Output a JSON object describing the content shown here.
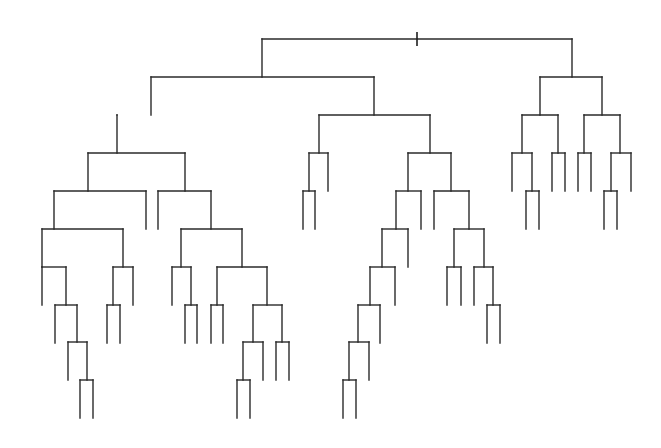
{
  "diagram": {
    "type": "dendrogram",
    "orientation": "top-down",
    "line_color": "#2a2a2a",
    "background": "#ffffff",
    "level_y": [
      39,
      77,
      115,
      153,
      191,
      229,
      267,
      305,
      342,
      380,
      418
    ],
    "leaf_length": 38,
    "root_tick": {
      "x": 417,
      "y1": 32,
      "y2": 46
    },
    "tree": {
      "x": 417,
      "children": [
        {
          "x": 262,
          "children": [
            {
              "x": 151,
              "children": [
                {
                  "x": 117,
                  "children": [
                    {
                      "x": 88,
                      "children": [
                        {
                          "x": 54,
                          "children": [
                            {
                              "x": 42,
                              "children": [
                                {
                                  "x": 42,
                                  "leaf": true
                                },
                                {
                                  "x": 66,
                                  "children": [
                                    {
                                      "x": 55,
                                      "leaf": true
                                    },
                                    {
                                      "x": 77,
                                      "children": [
                                        {
                                          "x": 68,
                                          "leaf": true
                                        },
                                        {
                                          "x": 87,
                                          "children": [
                                            {
                                              "x": 80,
                                              "leaf": true
                                            },
                                            {
                                              "x": 93,
                                              "leaf": true
                                            }
                                          ]
                                        }
                                      ]
                                    }
                                  ]
                                }
                              ]
                            },
                            {
                              "x": 123,
                              "children": [
                                {
                                  "x": 113,
                                  "children": [
                                    {
                                      "x": 107,
                                      "leaf": true
                                    },
                                    {
                                      "x": 120,
                                      "leaf": true
                                    }
                                  ]
                                },
                                {
                                  "x": 133,
                                  "leaf": true
                                }
                              ]
                            }
                          ]
                        },
                        {
                          "x": 146,
                          "leaf": true
                        }
                      ]
                    },
                    {
                      "x": 185,
                      "children": [
                        {
                          "x": 158,
                          "leaf": true
                        },
                        {
                          "x": 211,
                          "children": [
                            {
                              "x": 181,
                              "children": [
                                {
                                  "x": 172,
                                  "leaf": true
                                },
                                {
                                  "x": 191,
                                  "children": [
                                    {
                                      "x": 185,
                                      "leaf": true
                                    },
                                    {
                                      "x": 197,
                                      "leaf": true
                                    }
                                  ]
                                }
                              ]
                            },
                            {
                              "x": 242,
                              "children": [
                                {
                                  "x": 217,
                                  "children": [
                                    {
                                      "x": 211,
                                      "leaf": true
                                    },
                                    {
                                      "x": 223,
                                      "leaf": true
                                    }
                                  ]
                                },
                                {
                                  "x": 267,
                                  "children": [
                                    {
                                      "x": 253,
                                      "children": [
                                        {
                                          "x": 243,
                                          "children": [
                                            {
                                              "x": 237,
                                              "leaf": true
                                            },
                                            {
                                              "x": 250,
                                              "leaf": true
                                            }
                                          ]
                                        },
                                        {
                                          "x": 263,
                                          "leaf": true
                                        }
                                      ]
                                    },
                                    {
                                      "x": 282,
                                      "children": [
                                        {
                                          "x": 276,
                                          "leaf": true
                                        },
                                        {
                                          "x": 289,
                                          "leaf": true
                                        }
                                      ]
                                    }
                                  ]
                                }
                              ]
                            }
                          ]
                        }
                      ]
                    }
                  ]
                }
              ]
            },
            {
              "x": 374,
              "children": [
                {
                  "x": 319,
                  "children": [
                    {
                      "x": 309,
                      "children": [
                        {
                          "x": 303,
                          "leaf": true
                        },
                        {
                          "x": 315,
                          "leaf": true
                        }
                      ]
                    },
                    {
                      "x": 328,
                      "leaf": true
                    }
                  ]
                },
                {
                  "x": 430,
                  "children": [
                    {
                      "x": 408,
                      "children": [
                        {
                          "x": 396,
                          "children": [
                            {
                              "x": 382,
                              "children": [
                                {
                                  "x": 370,
                                  "children": [
                                    {
                                      "x": 358,
                                      "children": [
                                        {
                                          "x": 349,
                                          "children": [
                                            {
                                              "x": 343,
                                              "leaf": true
                                            },
                                            {
                                              "x": 356,
                                              "leaf": true
                                            }
                                          ]
                                        },
                                        {
                                          "x": 369,
                                          "leaf": true
                                        }
                                      ]
                                    },
                                    {
                                      "x": 380,
                                      "leaf": true
                                    }
                                  ]
                                },
                                {
                                  "x": 395,
                                  "leaf": true
                                }
                              ]
                            },
                            {
                              "x": 408,
                              "leaf": true
                            }
                          ]
                        },
                        {
                          "x": 421,
                          "leaf": true
                        }
                      ]
                    },
                    {
                      "x": 451,
                      "children": [
                        {
                          "x": 434,
                          "leaf": true
                        },
                        {
                          "x": 469,
                          "children": [
                            {
                              "x": 454,
                              "children": [
                                {
                                  "x": 447,
                                  "leaf": true
                                },
                                {
                                  "x": 461,
                                  "leaf": true
                                }
                              ]
                            },
                            {
                              "x": 484,
                              "children": [
                                {
                                  "x": 474,
                                  "leaf": true
                                },
                                {
                                  "x": 493,
                                  "children": [
                                    {
                                      "x": 487,
                                      "leaf": true
                                    },
                                    {
                                      "x": 500,
                                      "leaf": true
                                    }
                                  ]
                                }
                              ]
                            }
                          ]
                        }
                      ]
                    }
                  ]
                }
              ]
            }
          ]
        },
        {
          "x": 572,
          "children": [
            {
              "x": 540,
              "children": [
                {
                  "x": 522,
                  "children": [
                    {
                      "x": 512,
                      "leaf": true
                    },
                    {
                      "x": 532,
                      "children": [
                        {
                          "x": 526,
                          "leaf": true
                        },
                        {
                          "x": 539,
                          "leaf": true
                        }
                      ]
                    }
                  ]
                },
                {
                  "x": 558,
                  "children": [
                    {
                      "x": 552,
                      "leaf": true
                    },
                    {
                      "x": 565,
                      "leaf": true
                    }
                  ]
                }
              ]
            },
            {
              "x": 602,
              "children": [
                {
                  "x": 584,
                  "children": [
                    {
                      "x": 578,
                      "leaf": true
                    },
                    {
                      "x": 591,
                      "leaf": true
                    }
                  ]
                },
                {
                  "x": 620,
                  "children": [
                    {
                      "x": 611,
                      "children": [
                        {
                          "x": 604,
                          "leaf": true
                        },
                        {
                          "x": 617,
                          "leaf": true
                        }
                      ]
                    },
                    {
                      "x": 631,
                      "leaf": true
                    }
                  ]
                }
              ]
            }
          ]
        }
      ]
    }
  }
}
